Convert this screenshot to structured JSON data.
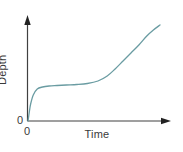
{
  "figure": {
    "background_color": "#ffffff",
    "width": 183,
    "height": 152
  },
  "axes": {
    "y_label": "Depth",
    "x_label": "Time",
    "origin_y_label": "0",
    "origin_x_label": "0",
    "axis_color": "#404040",
    "label_color": "#3a3a3a"
  },
  "chart_data": {
    "type": "line",
    "title": "",
    "xlabel": "Time",
    "ylabel": "Depth",
    "xlim": [
      0,
      100
    ],
    "ylim": [
      0,
      100
    ],
    "grid": false,
    "legend": null,
    "axis_arrows": true,
    "tick_labels": {
      "x": [
        "0"
      ],
      "y": [
        "0"
      ]
    },
    "series": [
      {
        "name": "Depth vs Time",
        "color": "#6a9ca2",
        "line_width": 1.3,
        "x": [
          0,
          1,
          2,
          4,
          7,
          11,
          16,
          22,
          29,
          37,
          45,
          53,
          60,
          66,
          72,
          78,
          84,
          90,
          95,
          100
        ],
        "y": [
          0,
          9,
          17,
          26,
          32,
          34,
          35,
          35.5,
          36,
          36.5,
          37.5,
          40,
          45,
          52,
          60,
          68,
          76,
          85,
          91,
          96
        ],
        "description": "Steep initial rise, then a long near-flat plateau, then an inflection into a steady near-linear climb to the upper right."
      }
    ]
  }
}
